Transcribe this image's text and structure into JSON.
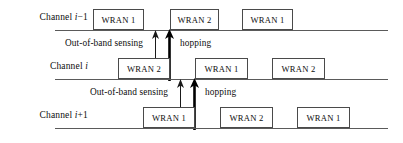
{
  "figure": {
    "colors": {
      "line": "#5a5a5a",
      "box_border": "#4a4a4a",
      "text": "#0d0d0d",
      "background": "#ffffff",
      "arrow_thin": "#1a1a1a",
      "arrow_thick": "#000000"
    }
  },
  "channels": [
    {
      "id": "channel-i-minus-1",
      "label_prefix": "Channel ",
      "label_var": "i",
      "label_suffix": "−1",
      "label_full": "Channel i−1",
      "baseline_y": 30,
      "boxes": [
        {
          "label": "WRAN 1",
          "x": 93,
          "width": 51
        },
        {
          "label": "WRAN 2",
          "x": 170,
          "width": 49
        },
        {
          "label": "WRAN 1",
          "x": 242,
          "width": 51
        }
      ]
    },
    {
      "id": "channel-i",
      "label_prefix": "Channel ",
      "label_var": "i",
      "label_suffix": "",
      "label_full": "Channel i",
      "baseline_y": 79,
      "boxes": [
        {
          "label": "WRAN 2",
          "x": 118,
          "width": 52
        },
        {
          "label": "WRAN 1",
          "x": 195,
          "width": 53
        },
        {
          "label": "WRAN 2",
          "x": 272,
          "width": 53
        }
      ]
    },
    {
      "id": "channel-i-plus-1",
      "label_prefix": "Channel ",
      "label_var": "i",
      "label_suffix": "+1",
      "label_full": "Channel i+1",
      "baseline_y": 128,
      "boxes": [
        {
          "label": "WRAN 1",
          "x": 143,
          "width": 52
        },
        {
          "label": "WRAN 2",
          "x": 220,
          "width": 53
        },
        {
          "label": "WRAN 1",
          "x": 297,
          "width": 53
        }
      ]
    }
  ],
  "annotations": [
    {
      "id": "group-upper",
      "sensing_label": "Out-of-band sensing",
      "hopping_label": "hopping",
      "sensing_x": 65,
      "hopping_x": 180,
      "label_y": 45,
      "thin_arrow_x": 155,
      "thick_arrow_x": 169,
      "arrow_top_y": 31,
      "thin_arrow_bottom_y": 79,
      "thick_arrow_bottom_y": 80
    },
    {
      "id": "group-lower",
      "sensing_label": "Out-of-band sensing",
      "hopping_label": "hopping",
      "sensing_x": 90,
      "hopping_x": 205,
      "label_y": 94,
      "thin_arrow_x": 180,
      "thick_arrow_x": 194,
      "arrow_top_y": 80,
      "thin_arrow_bottom_y": 128,
      "thick_arrow_bottom_y": 129
    }
  ],
  "geometry": {
    "baseline_x_start": 55,
    "baseline_x_end": 388,
    "box_height": 21,
    "label_right_edge": 88
  }
}
